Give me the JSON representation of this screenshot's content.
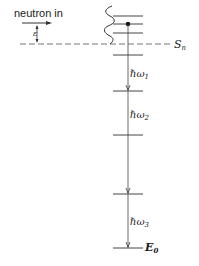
{
  "diagram": {
    "incoming_label": "neutron in",
    "epsilon_label": "ε",
    "separation_label": "S",
    "separation_sub": "n",
    "ground_label": "E",
    "ground_sub": "0",
    "transitions": [
      {
        "label": "ℏω",
        "sub": "1"
      },
      {
        "label": "ℏω",
        "sub": "2"
      },
      {
        "label": "ℏω",
        "sub": "3"
      }
    ],
    "colors": {
      "line": "#333333",
      "dashed": "#777777",
      "text": "#222222"
    }
  }
}
